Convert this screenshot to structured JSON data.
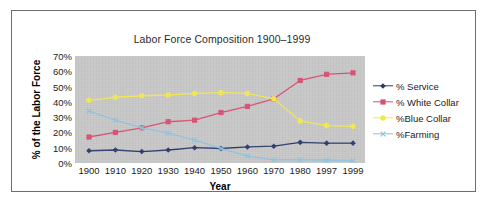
{
  "chart_data": {
    "type": "line",
    "title": "Labor Force Composition 1900–1999",
    "xlabel": "Year",
    "ylabel": "% of the Labor Force",
    "categories": [
      "1900",
      "1910",
      "1920",
      "1930",
      "1940",
      "1950",
      "1960",
      "1970",
      "1980",
      "1997",
      "1999"
    ],
    "ylim": [
      0,
      70
    ],
    "ytick_labels": [
      "0%",
      "10%",
      "20%",
      "30%",
      "40%",
      "50%",
      "60%",
      "70%"
    ],
    "ytick_values": [
      0,
      10,
      20,
      30,
      40,
      50,
      60,
      70
    ],
    "grid": false,
    "legend_position": "right",
    "plot_background": "#c6c6c6",
    "series": [
      {
        "name": "% Service",
        "color": "#2b3a6b",
        "marker": "diamond",
        "values": [
          8,
          8.5,
          7.5,
          8.5,
          10,
          9.5,
          10.5,
          11,
          13.5,
          13,
          13
        ]
      },
      {
        "name": "% White Collar",
        "color": "#d94f72",
        "marker": "square",
        "values": [
          17,
          20,
          23,
          27,
          28,
          33,
          37,
          42,
          54,
          58,
          59
        ]
      },
      {
        "name": "%Blue Collar",
        "color": "#f2e84a",
        "marker": "circle",
        "values": [
          41,
          43,
          44,
          44.5,
          45.5,
          46,
          45.5,
          42,
          27.5,
          24.5,
          24
        ]
      },
      {
        "name": "%Farming",
        "color": "#8fc2dd",
        "marker": "x",
        "values": [
          34,
          28,
          23,
          19.5,
          15,
          9.5,
          4.5,
          2,
          2,
          1.8,
          1.5
        ]
      }
    ]
  }
}
